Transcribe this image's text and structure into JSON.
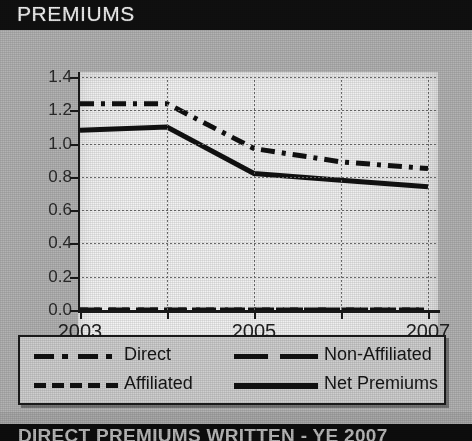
{
  "title": "PREMIUMS",
  "footer": {
    "left": "See Sec. 2, B.3",
    "right": "$ Millions"
  },
  "bottom_caption": "DIRECT PREMIUMS WRITTEN - YE 2007",
  "legend": {
    "items": [
      {
        "label": "Direct",
        "style": "dash-dot"
      },
      {
        "label": "Non-Affiliated",
        "style": "dash-long"
      },
      {
        "label": "Affiliated",
        "style": "dash-short"
      },
      {
        "label": "Net Premiums",
        "style": "solid"
      }
    ]
  },
  "colors": {
    "title_band": "#101010",
    "card": "#b3b3b3",
    "plot_bg": "#f0f0f0",
    "line": "#111111",
    "grid": "#6d6d6d"
  },
  "chart_data": {
    "type": "line",
    "title": "PREMIUMS",
    "xlabel": "",
    "ylabel": "",
    "unit": "$ Millions",
    "x": [
      2003,
      2004,
      2005,
      2006,
      2007
    ],
    "xtick_labels": [
      "2003",
      "",
      "2005",
      "",
      "2007"
    ],
    "xlim": [
      2003,
      2007
    ],
    "ylim": [
      0.0,
      1.4
    ],
    "ytick_labels": [
      "0.0",
      "0.2",
      "0.4",
      "0.6",
      "0.8",
      "1.0",
      "1.2",
      "1.4"
    ],
    "ytick_values": [
      0.0,
      0.2,
      0.4,
      0.6,
      0.8,
      1.0,
      1.2,
      1.4
    ],
    "grid": true,
    "legend_position": "below",
    "series": [
      {
        "name": "Direct",
        "style": "dash-dot",
        "values": [
          1.24,
          1.24,
          0.97,
          0.89,
          0.85
        ]
      },
      {
        "name": "Non-Affiliated",
        "style": "dash-long",
        "values": [
          0.0,
          0.0,
          0.0,
          0.0,
          0.0
        ]
      },
      {
        "name": "Affiliated",
        "style": "dash-short",
        "values": [
          0.0,
          0.0,
          0.0,
          0.0,
          0.0
        ]
      },
      {
        "name": "Net Premiums",
        "style": "solid",
        "values": [
          1.08,
          1.1,
          0.82,
          0.78,
          0.74
        ]
      }
    ]
  }
}
